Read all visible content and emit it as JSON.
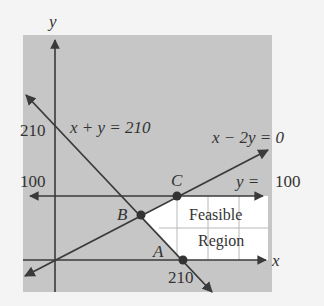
{
  "colors": {
    "page_bg": "#f4f4f4",
    "plot_bg": "#c6c6c6",
    "feasible_fill": "#ffffff",
    "grid": "#b8b8b8",
    "line": "#3a3a3a",
    "text": "#333333"
  },
  "axes": {
    "x_label": "x",
    "y_label": "y",
    "y_tick_210": "210",
    "y_tick_100": "100",
    "x_tick_210": "210"
  },
  "lines": [
    {
      "id": "x_plus_y",
      "label": "x + y = 210"
    },
    {
      "id": "x_minus_2y",
      "label": "x − 2y = 0"
    },
    {
      "id": "y_eq_100",
      "label_lhs": "y =",
      "label_rhs": "100"
    }
  ],
  "points": [
    {
      "name": "A"
    },
    {
      "name": "B"
    },
    {
      "name": "C"
    }
  ],
  "region": {
    "line1": "Feasible",
    "line2": "Region"
  }
}
